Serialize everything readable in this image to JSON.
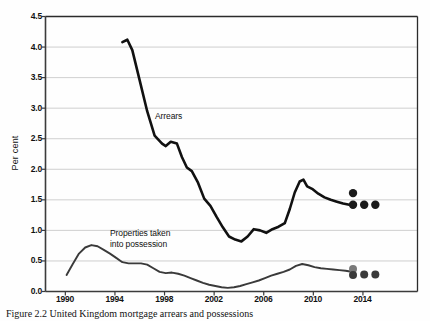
{
  "chart_data": {
    "type": "line",
    "title": "",
    "xlabel": "",
    "ylabel": "Per cent",
    "xlim": [
      1988.4,
      2018.4
    ],
    "ylim": [
      0.0,
      4.5
    ],
    "grid": true,
    "legend": "inline-labels",
    "y_ticks": [
      "0.0",
      "0.5",
      "1.0",
      "1.5",
      "2.0",
      "2.5",
      "3.0",
      "3.5",
      "4.0",
      "4.5"
    ],
    "y_tick_values": [
      0.0,
      0.5,
      1.0,
      1.5,
      2.0,
      2.5,
      3.0,
      3.5,
      4.0,
      4.5
    ],
    "x_ticks": [
      "1990",
      "1994",
      "1998",
      "2002",
      "2006",
      "2010",
      "2014"
    ],
    "x_tick_values": [
      1990,
      1994,
      1998,
      2002,
      2006,
      2010,
      2014
    ],
    "series": [
      {
        "name": "Arrears",
        "label_text": "Arrears",
        "color": "#111111",
        "width": 2.6,
        "x": [
          1994.6,
          1995.0,
          1995.4,
          1996.0,
          1996.6,
          1997.2,
          1997.8,
          1998.1,
          1998.5,
          1999.0,
          1999.4,
          1999.8,
          2000.2,
          2000.7,
          2001.2,
          2001.7,
          2002.2,
          2002.7,
          2003.2,
          2003.7,
          2004.2,
          2004.7,
          2005.2,
          2005.7,
          2006.2,
          2006.7,
          2007.2,
          2007.7,
          2008.1,
          2008.5,
          2008.9,
          2009.2,
          2009.5,
          2009.9,
          2010.4,
          2010.9,
          2011.4,
          2011.9,
          2012.4,
          2012.9,
          2013.2
        ],
        "y": [
          4.08,
          4.12,
          3.95,
          3.45,
          2.95,
          2.55,
          2.42,
          2.38,
          2.45,
          2.42,
          2.2,
          2.03,
          1.97,
          1.78,
          1.52,
          1.4,
          1.22,
          1.05,
          0.9,
          0.85,
          0.82,
          0.9,
          1.02,
          1.0,
          0.96,
          1.02,
          1.06,
          1.12,
          1.35,
          1.62,
          1.8,
          1.83,
          1.72,
          1.68,
          1.6,
          1.54,
          1.5,
          1.47,
          1.44,
          1.42,
          1.41
        ]
      },
      {
        "name": "Properties taken into possession",
        "label_text": "Properties taken\ninto possession",
        "color": "#3a3a3a",
        "width": 1.9,
        "x": [
          1990.1,
          1990.6,
          1991.1,
          1991.6,
          1992.1,
          1992.6,
          1993.1,
          1993.6,
          1994.1,
          1994.6,
          1995.1,
          1995.6,
          1996.1,
          1996.6,
          1997.1,
          1997.6,
          1998.1,
          1998.6,
          1999.1,
          1999.6,
          2000.1,
          2000.6,
          2001.1,
          2001.6,
          2002.1,
          2002.6,
          2003.1,
          2003.6,
          2004.1,
          2004.6,
          2005.1,
          2005.6,
          2006.1,
          2006.6,
          2007.1,
          2007.6,
          2008.1,
          2008.6,
          2009.1,
          2009.6,
          2010.1,
          2010.6,
          2011.1,
          2011.6,
          2012.1,
          2012.6,
          2013.2
        ],
        "y": [
          0.27,
          0.45,
          0.62,
          0.72,
          0.76,
          0.74,
          0.68,
          0.62,
          0.55,
          0.48,
          0.46,
          0.46,
          0.46,
          0.44,
          0.38,
          0.32,
          0.3,
          0.31,
          0.29,
          0.26,
          0.22,
          0.18,
          0.14,
          0.11,
          0.09,
          0.07,
          0.06,
          0.07,
          0.09,
          0.12,
          0.15,
          0.18,
          0.22,
          0.26,
          0.29,
          0.32,
          0.36,
          0.42,
          0.45,
          0.43,
          0.4,
          0.38,
          0.37,
          0.36,
          0.35,
          0.34,
          0.32
        ]
      }
    ],
    "points": [
      {
        "group": "arrears-forecast",
        "x": 2013.2,
        "y": 1.61,
        "color": "#1a1a1a",
        "r": 4.2
      },
      {
        "group": "arrears-forecast",
        "x": 2013.2,
        "y": 1.42,
        "color": "#1a1a1a",
        "r": 4.2
      },
      {
        "group": "arrears-forecast",
        "x": 2014.1,
        "y": 1.42,
        "color": "#1a1a1a",
        "r": 4.2
      },
      {
        "group": "arrears-forecast",
        "x": 2015.0,
        "y": 1.42,
        "color": "#1a1a1a",
        "r": 4.2
      },
      {
        "group": "possession-forecast",
        "x": 2013.2,
        "y": 0.37,
        "color": "#7a7a7a",
        "r": 4.0
      },
      {
        "group": "possession-forecast",
        "x": 2013.2,
        "y": 0.27,
        "color": "#3a3a3a",
        "r": 4.0
      },
      {
        "group": "possession-forecast",
        "x": 2014.1,
        "y": 0.28,
        "color": "#3a3a3a",
        "r": 4.0
      },
      {
        "group": "possession-forecast",
        "x": 2015.0,
        "y": 0.28,
        "color": "#3a3a3a",
        "r": 4.0
      }
    ],
    "annotations": [
      {
        "name": "arrears-label",
        "text": "Arrears",
        "x": 1998.0,
        "y": 2.82
      },
      {
        "name": "possession-label",
        "text": "Properties taken",
        "x": 1995.2,
        "y": 0.97
      },
      {
        "name": "possession-label-2",
        "text": "into possession",
        "x": 1995.2,
        "y": 0.8
      }
    ]
  },
  "axis": {
    "y_title": "Per cent",
    "y_ticks": [
      "4.5",
      "4.0",
      "3.5",
      "3.0",
      "2.5",
      "2.0",
      "1.5",
      "1.0",
      "0.5",
      "0.0"
    ],
    "x_ticks": [
      "1990",
      "1994",
      "1998",
      "2002",
      "2006",
      "2010",
      "2014"
    ]
  },
  "labels": {
    "arrears": "Arrears",
    "possession_line1": "Properties taken",
    "possession_line2": "into possession"
  },
  "caption": {
    "text": "Figure 2.2  United Kingdom mortgage arrears and possessions"
  },
  "colors": {
    "arrears_line": "#111111",
    "possession_line": "#3a3a3a",
    "grid": "#c9c9c9",
    "axis": "#3b3b3b",
    "background": "#fefefe"
  }
}
